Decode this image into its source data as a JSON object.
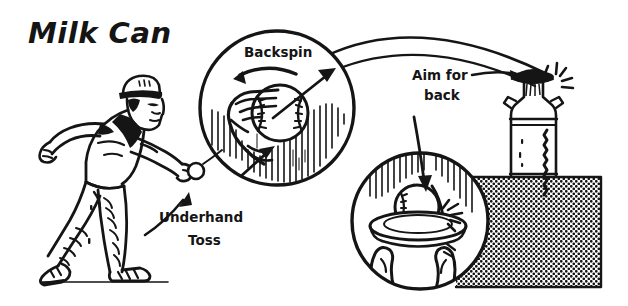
{
  "illustration": {
    "title": "Milk Can",
    "type": "instructional-diagram",
    "style": "black-and-white line art",
    "background_color": "#ffffff",
    "ink_color": "#151515",
    "width": 628,
    "height": 306
  },
  "labels": {
    "title": "Milk Can",
    "backspin": "Backspin",
    "aim_for_back_line1": "Aim for",
    "aim_for_back_line2": "back",
    "underhand_toss_line1": "Underhand",
    "underhand_toss_line2": "Toss"
  },
  "figures": {
    "thrower": {
      "name": "man-throwing-ball",
      "description": "Man wearing a cap, short-sleeve shirt and jeans, striding forward and releasing a ball underhand",
      "holds": "baseball"
    },
    "detail_circle_backspin": {
      "name": "backspin-detail-circle",
      "description": "Close-up of a hand gripping a baseball with curved arrow showing backspin rotation and straight arrow showing release direction",
      "arrows": [
        "rotation-arrow",
        "release-arrow",
        "pointer-arrow"
      ]
    },
    "detail_circle_impact": {
      "name": "impact-detail-circle",
      "description": "Close-up of the ball striking the back inside rim of the milk can, with impact burst lines",
      "arrows": [
        "impact-arrow"
      ]
    },
    "milk_can": {
      "name": "milk-can-target",
      "description": "Metal milk can with lid and side handles standing on a shaded pedestal, with impact sparks at the lid"
    },
    "pedestal": {
      "name": "pedestal-platform",
      "description": "Halftone-shaded rectangular platform supporting the milk can"
    },
    "trajectory": {
      "name": "ball-trajectory-arc",
      "description": "Two parallel arcing lines tracing the flight path of the ball from the thrower to the milk can"
    }
  },
  "annotations": [
    {
      "id": "backspin",
      "text": "Backspin",
      "points_to": "hand-gripping-ball"
    },
    {
      "id": "aim-for-back",
      "text": "Aim for back",
      "points_to": "milk-can-opening"
    },
    {
      "id": "underhand-toss",
      "text": "Underhand Toss",
      "points_to": "throwers-release-hand"
    }
  ]
}
